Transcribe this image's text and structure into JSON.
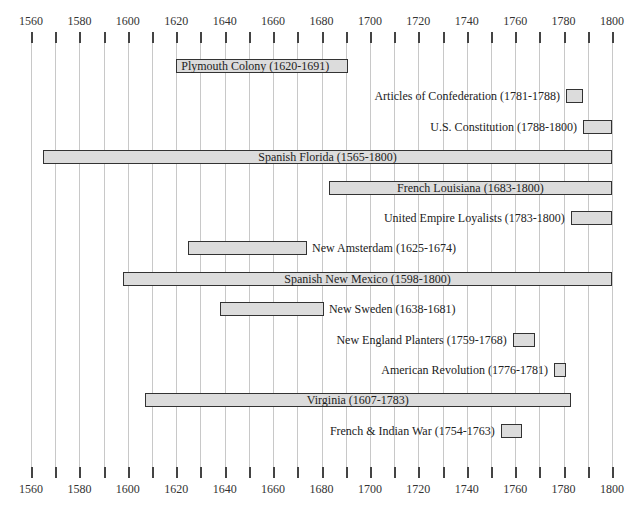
{
  "chart_data": {
    "type": "bar",
    "subtype": "timeline-gantt",
    "title": "",
    "xlabel": "",
    "ylabel": "",
    "xlim": [
      1560,
      1800
    ],
    "x_ticks": [
      1560,
      1580,
      1600,
      1620,
      1640,
      1660,
      1680,
      1700,
      1720,
      1740,
      1760,
      1780,
      1800
    ],
    "minor_tick_interval": 10,
    "grid": true,
    "axis_labels_top_and_bottom": true,
    "bar_fill": "#dcdcdc",
    "bar_border": "#333333",
    "items": [
      {
        "label": "Plymouth Colony (1620-1691)",
        "start": 1620,
        "end": 1691,
        "label_pos": "inside-left"
      },
      {
        "label": "Articles of Confederation (1781-1788)",
        "start": 1781,
        "end": 1788,
        "label_pos": "left"
      },
      {
        "label": "U.S. Constitution (1788-1800)",
        "start": 1788,
        "end": 1800,
        "label_pos": "left"
      },
      {
        "label": "Spanish Florida (1565-1800)",
        "start": 1565,
        "end": 1800,
        "label_pos": "inside-center"
      },
      {
        "label": "French Louisiana (1683-1800)",
        "start": 1683,
        "end": 1800,
        "label_pos": "inside-center"
      },
      {
        "label": "United Empire Loyalists (1783-1800)",
        "start": 1783,
        "end": 1800,
        "label_pos": "left"
      },
      {
        "label": "New Amsterdam (1625-1674)",
        "start": 1625,
        "end": 1674,
        "label_pos": "right"
      },
      {
        "label": "Spanish New Mexico (1598-1800)",
        "start": 1598,
        "end": 1800,
        "label_pos": "inside-center"
      },
      {
        "label": "New Sweden (1638-1681)",
        "start": 1638,
        "end": 1681,
        "label_pos": "right"
      },
      {
        "label": "New England Planters (1759-1768)",
        "start": 1759,
        "end": 1768,
        "label_pos": "left"
      },
      {
        "label": "American Revolution (1776-1781)",
        "start": 1776,
        "end": 1781,
        "label_pos": "left"
      },
      {
        "label": "Virginia (1607-1783)",
        "start": 1607,
        "end": 1783,
        "label_pos": "inside-center"
      },
      {
        "label": "French & Indian War (1754-1763)",
        "start": 1754,
        "end": 1763,
        "label_pos": "left"
      }
    ]
  }
}
